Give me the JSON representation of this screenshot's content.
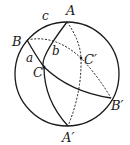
{
  "diagram": {
    "type": "spherical-triangle",
    "colors": {
      "ink": "#1a1a1a",
      "background": "#ffffff"
    },
    "labels": {
      "A": "A",
      "B": "B",
      "C": "C",
      "A_prime": "A′",
      "B_prime": "B′",
      "C_prime": "C′",
      "side_a": "a",
      "side_b": "b",
      "side_c": "c"
    }
  }
}
